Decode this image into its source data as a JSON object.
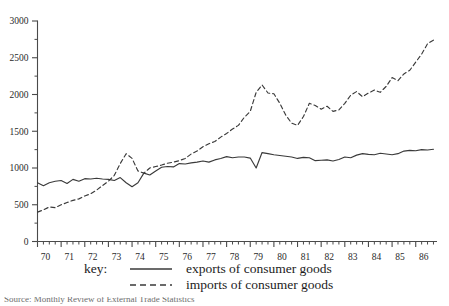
{
  "chart_data": {
    "type": "line",
    "title": "",
    "subtitle": "",
    "xlabel": "",
    "ylabel": "",
    "xlim": [
      1970.0,
      1986.9
    ],
    "ylim": [
      0,
      3000
    ],
    "grid": false,
    "legend_position": "below-axes",
    "y_ticks": [
      0,
      500,
      1000,
      1500,
      2000,
      2500,
      3000
    ],
    "y_tick_labels": [
      "0",
      "500",
      "1000",
      "1500",
      "2000",
      "2500",
      "3000"
    ],
    "y_minor_tick_interval": 250,
    "x_ticks": [
      1970,
      1971,
      1972,
      1973,
      1974,
      1975,
      1976,
      1977,
      1978,
      1979,
      1980,
      1981,
      1982,
      1983,
      1984,
      1985,
      1986
    ],
    "x_tick_labels": [
      "70",
      "71",
      "72",
      "73",
      "74",
      "75",
      "76",
      "77",
      "78",
      "79",
      "80",
      "81",
      "82",
      "83",
      "84",
      "85",
      "86"
    ],
    "x_minor_ticks_per_year": 4,
    "x": [
      1970.0,
      1970.25,
      1970.5,
      1970.75,
      1971.0,
      1971.25,
      1971.5,
      1971.75,
      1972.0,
      1972.25,
      1972.5,
      1972.75,
      1973.0,
      1973.25,
      1973.5,
      1973.75,
      1974.0,
      1974.25,
      1974.5,
      1974.75,
      1975.0,
      1975.25,
      1975.5,
      1975.75,
      1976.0,
      1976.25,
      1976.5,
      1976.75,
      1977.0,
      1977.25,
      1977.5,
      1977.75,
      1978.0,
      1978.25,
      1978.5,
      1978.75,
      1979.0,
      1979.25,
      1979.5,
      1979.75,
      1980.0,
      1980.25,
      1980.5,
      1980.75,
      1981.0,
      1981.25,
      1981.5,
      1981.75,
      1982.0,
      1982.25,
      1982.5,
      1982.75,
      1983.0,
      1983.25,
      1983.5,
      1983.75,
      1984.0,
      1984.25,
      1984.5,
      1984.75,
      1985.0,
      1985.25,
      1985.5,
      1985.75,
      1986.0,
      1986.25,
      1986.5,
      1986.75
    ],
    "series": [
      {
        "name": "exports of consumer goods",
        "style": "solid",
        "color": "#3a3a3a",
        "values": [
          800,
          760,
          800,
          820,
          830,
          790,
          845,
          820,
          855,
          850,
          860,
          850,
          845,
          830,
          870,
          800,
          745,
          800,
          930,
          905,
          960,
          1010,
          1020,
          1015,
          1060,
          1055,
          1070,
          1080,
          1095,
          1080,
          1110,
          1130,
          1155,
          1140,
          1150,
          1150,
          1135,
          1000,
          1210,
          1195,
          1180,
          1170,
          1160,
          1150,
          1130,
          1145,
          1140,
          1100,
          1105,
          1110,
          1095,
          1115,
          1150,
          1140,
          1175,
          1195,
          1185,
          1180,
          1200,
          1190,
          1180,
          1195,
          1230,
          1240,
          1235,
          1250,
          1245,
          1255
        ]
      },
      {
        "name": "imports of consumer goods",
        "style": "dashed",
        "color": "#3a3a3a",
        "values": [
          400,
          430,
          470,
          460,
          500,
          530,
          560,
          580,
          620,
          650,
          700,
          760,
          820,
          900,
          1060,
          1195,
          1130,
          960,
          930,
          1000,
          1020,
          1040,
          1065,
          1080,
          1100,
          1130,
          1190,
          1230,
          1290,
          1330,
          1360,
          1420,
          1470,
          1530,
          1580,
          1690,
          1770,
          2030,
          2130,
          2020,
          2010,
          1880,
          1720,
          1610,
          1580,
          1700,
          1880,
          1850,
          1800,
          1840,
          1770,
          1790,
          1880,
          1990,
          2040,
          1970,
          2020,
          2060,
          2030,
          2110,
          2230,
          2190,
          2280,
          2330,
          2440,
          2550,
          2690,
          2740
        ]
      }
    ]
  },
  "legend": {
    "key_word": "key:",
    "entries": [
      {
        "label": "exports of consumer goods",
        "style": "solid"
      },
      {
        "label": "imports of consumer goods",
        "style": "dashed"
      }
    ]
  },
  "caption": {
    "text": "Source: Monthly Review of External Trade Statistics"
  }
}
